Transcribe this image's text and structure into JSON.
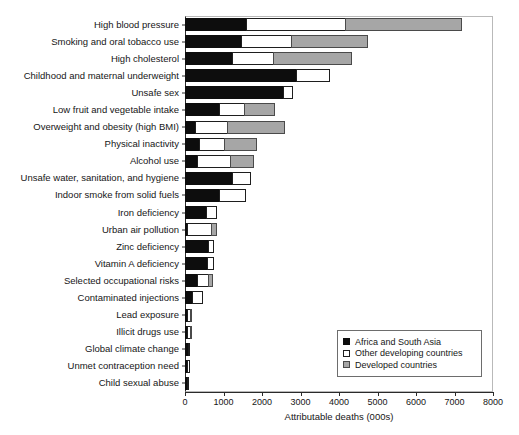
{
  "chart_data": {
    "type": "bar",
    "orientation": "horizontal",
    "stacked": true,
    "title": "",
    "xlabel": "Attributable deaths (000s)",
    "ylabel": "",
    "xlim": [
      0,
      8000
    ],
    "xticks": [
      0,
      1000,
      2000,
      3000,
      4000,
      5000,
      6000,
      7000,
      8000
    ],
    "grid": false,
    "legend_position": "bottom-right",
    "categories": [
      "High blood pressure",
      "Smoking and oral tobacco use",
      "High cholesterol",
      "Childhood and maternal underweight",
      "Unsafe sex",
      "Low fruit and vegetable intake",
      "Overweight and obesity (high BMI)",
      "Physical inactivity",
      "Alcohol use",
      "Unsafe water, sanitation, and hygiene",
      "Indoor smoke from solid fuels",
      "Iron deficiency",
      "Urban air pollution",
      "Zinc deficiency",
      "Vitamin A deficiency",
      "Selected occupational risks",
      "Contaminated injections",
      "Lead exposure",
      "Illicit drugs use",
      "Global climate change",
      "Unmet contraception need",
      "Child sexual abuse"
    ],
    "series": [
      {
        "name": "Africa and South Asia",
        "color": "#0d0d0d",
        "values": [
          1620,
          1480,
          1250,
          2920,
          2560,
          900,
          290,
          400,
          330,
          1250,
          900,
          580,
          60,
          620,
          610,
          340,
          210,
          70,
          60,
          100,
          90,
          50
        ]
      },
      {
        "name": "Other developing countries",
        "color": "#ffffff",
        "values": [
          2580,
          1320,
          1100,
          880,
          260,
          680,
          860,
          660,
          890,
          500,
          700,
          280,
          660,
          160,
          170,
          320,
          290,
          110,
          110,
          20,
          30,
          20
        ]
      },
      {
        "name": "Developed countries",
        "color": "#a6a6a6",
        "values": [
          3050,
          2000,
          2050,
          0,
          0,
          820,
          1500,
          860,
          630,
          0,
          0,
          0,
          150,
          0,
          0,
          130,
          0,
          60,
          60,
          0,
          0,
          0
        ]
      }
    ],
    "totals": [
      7250,
      4800,
      4400,
      3800,
      2820,
      2400,
      2650,
      1920,
      1850,
      1750,
      1600,
      860,
      870,
      780,
      780,
      790,
      500,
      240,
      230,
      120,
      120,
      70
    ]
  },
  "legend": {
    "items": [
      {
        "label": "Africa and South Asia",
        "swatch": "africa"
      },
      {
        "label": "Other developing countries",
        "swatch": "other"
      },
      {
        "label": "Developed countries",
        "swatch": "developed"
      }
    ]
  },
  "axis": {
    "x_title": "Attributable deaths (000s)",
    "x_tick_labels": [
      "0",
      "1000",
      "2000",
      "3000",
      "4000",
      "5000",
      "6000",
      "7000",
      "8000"
    ]
  }
}
